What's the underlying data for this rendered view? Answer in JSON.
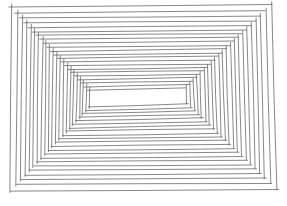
{
  "title": "Hand-drawn nested rectangles line drawing",
  "drawing": {
    "background": "#ffffff",
    "stroke_color": "#555555",
    "stroke_width": 0.7,
    "ring_count": 22,
    "outer": {
      "tl": [
        12,
        7
      ],
      "tr": [
        272,
        5
      ],
      "br": [
        277,
        190
      ],
      "bl": [
        10,
        191
      ]
    },
    "inner": {
      "tl": [
        90,
        90
      ],
      "tr": [
        186,
        88
      ],
      "br": [
        187,
        104
      ],
      "bl": [
        89,
        107
      ]
    },
    "overshoot": 3
  }
}
